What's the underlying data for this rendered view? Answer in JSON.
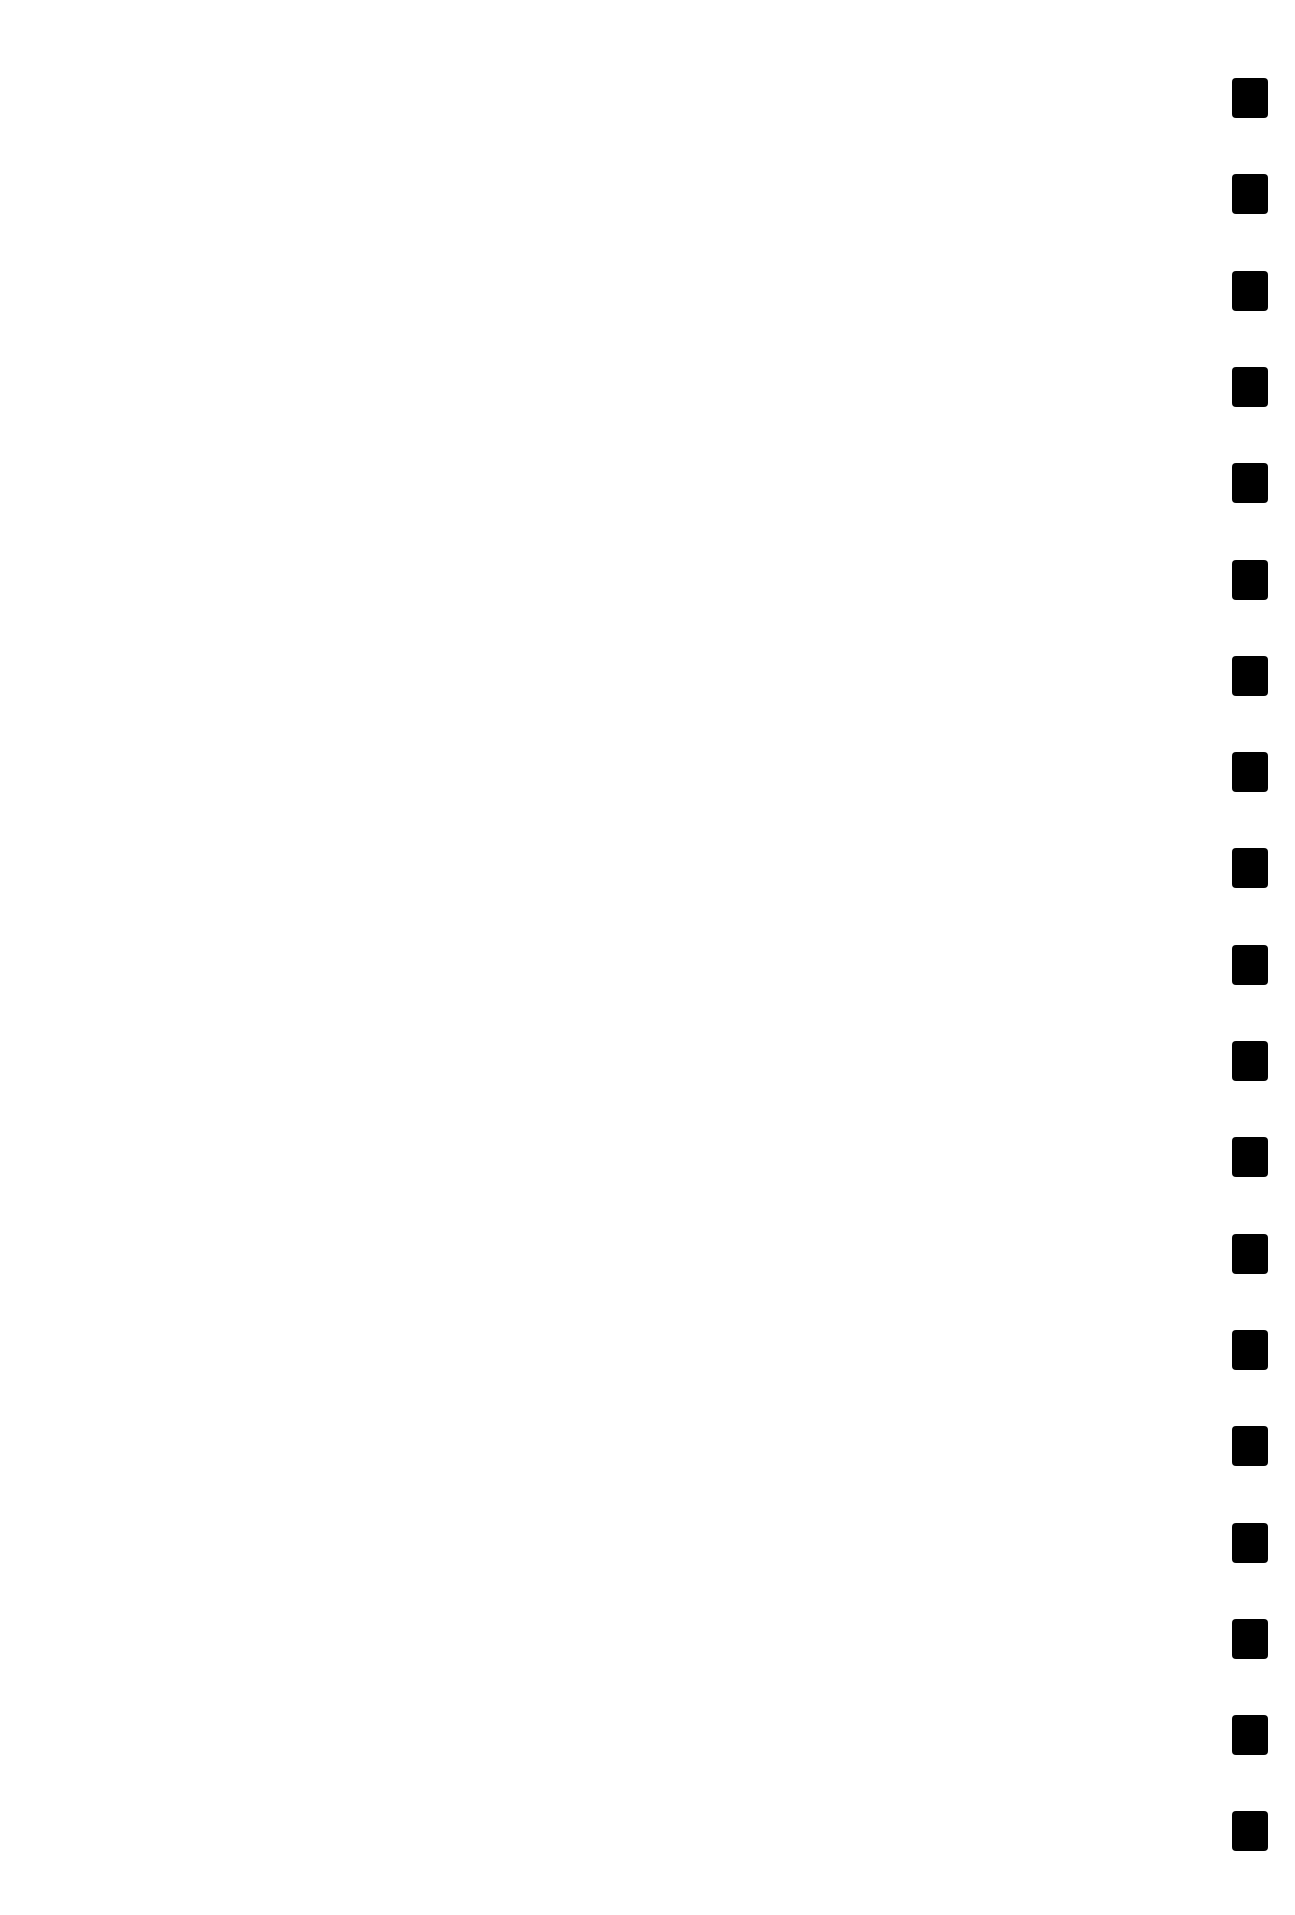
{
  "page": {
    "type": "blank scanned page",
    "background_color": "#ffffff",
    "binding_holes": {
      "count": 19,
      "color": "#000000",
      "side": "right"
    }
  }
}
